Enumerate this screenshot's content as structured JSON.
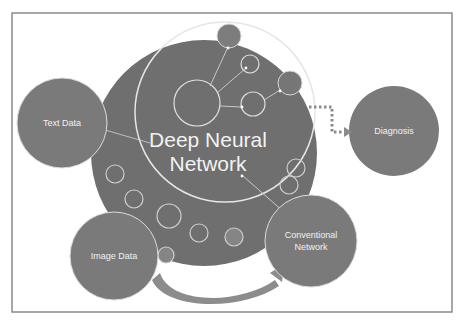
{
  "diagram": {
    "frame": {
      "border_color": "#8a8a8a",
      "background": "#ffffff"
    },
    "colors": {
      "node_fill": "#7a7a7a",
      "dnn_fill": "#6f6f6f",
      "outline": "#d9d9d9",
      "text": "#f2f2f2",
      "arrow": "#8c8c8c"
    },
    "center_node": {
      "line1": "Deep Neural",
      "line2": "Network"
    },
    "nodes": [
      {
        "id": "text-data",
        "label": "Text Data"
      },
      {
        "id": "image-data",
        "label": "Image Data"
      },
      {
        "id": "conventional-network",
        "label_line1": "Conventional",
        "label_line2": "Network"
      },
      {
        "id": "diagnosis",
        "label": "Diagnosis"
      }
    ],
    "edges": [
      {
        "from": "Text Data",
        "to": "Deep Neural Network",
        "style": "line"
      },
      {
        "from": "Deep Neural Network",
        "to": "Diagnosis",
        "style": "dotted-arrow"
      },
      {
        "from": "Deep Neural Network",
        "to": "Conventional Network",
        "style": "line"
      },
      {
        "from": "Image Data",
        "to": "Conventional Network",
        "style": "curved-arrow"
      }
    ]
  }
}
